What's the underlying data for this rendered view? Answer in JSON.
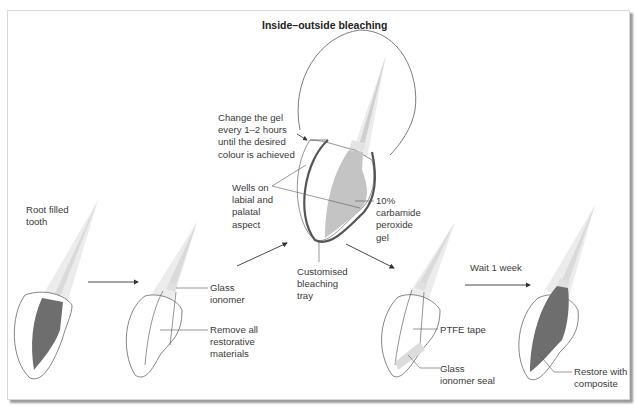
{
  "figure": {
    "title": "Inside–outside bleaching",
    "colors": {
      "enamel_outline": "#5a5a5a",
      "root_fill": "#e6e6e6",
      "pulp_dark": "#6e6e6e",
      "gel_fill": "#c4c4c4",
      "tray": "#555555",
      "seal_fill": "#dcdcdc",
      "arrow": "#333333",
      "text": "#3a3a3a"
    }
  },
  "labels": {
    "root_filled_tooth": "Root filled\ntooth",
    "glass_ionomer": "Glass\nionomer",
    "remove_all": "Remove all\nrestorative\nmaterials",
    "change_gel": "Change the gel\nevery 1–2 hours\nuntil the desired\ncolour is achieved",
    "wells": "Wells on\nlabial and\npalatal\naspect",
    "carbamide": "10%\ncarbamide\nperoxide\ngel",
    "customised_tray": "Customised\nbleaching\ntray",
    "wait": "Wait 1 week",
    "ptfe": "PTFE tape",
    "glass_ionomer_seal": "Glass\nionomer seal",
    "restore": "Restore with\ncomposite"
  },
  "steps": [
    {
      "name": "root-filled-tooth",
      "order": 1
    },
    {
      "name": "access-prepared",
      "order": 2
    },
    {
      "name": "tray-bleaching",
      "order": 3
    },
    {
      "name": "sealed-cavity",
      "order": 4
    },
    {
      "name": "restored-tooth",
      "order": 5
    }
  ]
}
